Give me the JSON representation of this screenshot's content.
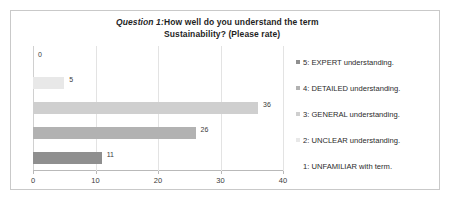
{
  "chart_data": {
    "type": "bar",
    "orientation": "horizontal",
    "title_label": "Question 1:",
    "title_text": "How well do you understand the term Sustainability? (Please rate)",
    "title_line1": "How well do you understand the term",
    "title_line2": "Sustainability? (Please rate)",
    "categories": [
      "5: EXPERT understanding.",
      "4: DETAILED understanding.",
      "3: GENERAL understanding.",
      "2: UNCLEAR understanding.",
      "1: UNFAMILIAR with term."
    ],
    "values": [
      0,
      5,
      36,
      26,
      11
    ],
    "value_labels": [
      "0",
      "5",
      "36",
      "26",
      "11"
    ],
    "bar_colors": [
      "#ffffff",
      "#e8e8e8",
      "#cfcfcf",
      "#b2b2b2",
      "#8f8f8f"
    ],
    "xlabel": "",
    "ylabel": "",
    "xlim": [
      0,
      40
    ],
    "xticks": [
      0,
      10,
      20,
      30,
      40
    ],
    "xtick_labels": [
      "0",
      "10",
      "20",
      "30",
      "40"
    ],
    "grid": true,
    "legend_position": "right",
    "legend": [
      {
        "label": "5: EXPERT understanding.",
        "color": "#8f8f8f"
      },
      {
        "label": "4: DETAILED understanding.",
        "color": "#b2b2b2"
      },
      {
        "label": "3: GENERAL understanding.",
        "color": "#cfcfcf"
      },
      {
        "label": "2: UNCLEAR understanding.",
        "color": "#e8e8e8"
      },
      {
        "label": "1: UNFAMILIAR with term.",
        "color": "#ffffff"
      }
    ]
  },
  "frame": {
    "border_color": "#c9c9c9",
    "background": "#ffffff"
  }
}
